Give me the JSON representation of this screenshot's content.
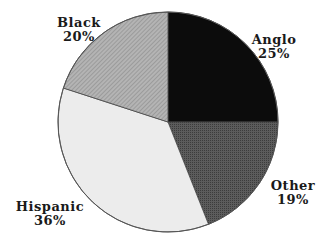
{
  "chart_data": {
    "type": "pie",
    "title": "",
    "categories": [
      "Anglo",
      "Other",
      "Hispanic",
      "Black"
    ],
    "values": [
      25,
      19,
      36,
      20
    ],
    "value_labels": [
      "25%",
      "19%",
      "36%",
      "20%"
    ],
    "start_angle_deg": 0,
    "direction": "clockwise",
    "colors": [
      "#0c0c0c",
      "#5a5a5a",
      "#ececec",
      "#a8a8a8"
    ],
    "legend": "none",
    "labels_position": "outside"
  },
  "labels": {
    "anglo": {
      "name": "Anglo",
      "pct": "25%"
    },
    "other": {
      "name": "Other",
      "pct": "19%"
    },
    "hispanic": {
      "name": "Hispanic",
      "pct": "36%"
    },
    "black": {
      "name": "Black",
      "pct": "20%"
    }
  }
}
